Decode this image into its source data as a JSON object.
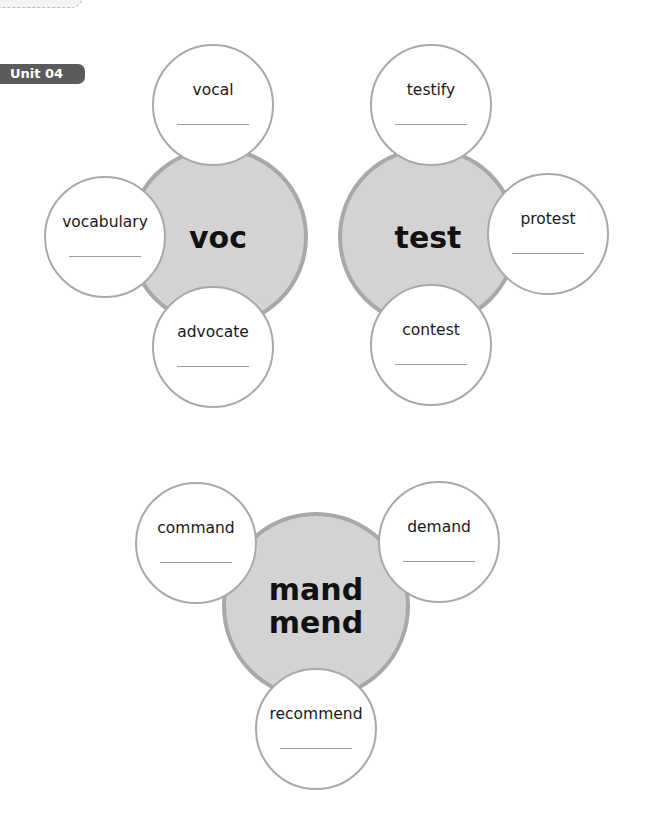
{
  "unit_badge": {
    "label": "Unit 04"
  },
  "colors": {
    "badge": "#5b5b5b",
    "core_fill": "#d3d3d3",
    "core_border": "#a8a8a8",
    "satellite_border": "#a9a9a9"
  },
  "clusters": [
    {
      "root": "voc",
      "words": [
        "vocal",
        "vocabulary",
        "advocate"
      ]
    },
    {
      "root": "test",
      "words": [
        "testify",
        "protest",
        "contest"
      ]
    },
    {
      "root": "mand\nmend",
      "words": [
        "command",
        "demand",
        "recommend"
      ]
    }
  ],
  "answer_blank": ""
}
